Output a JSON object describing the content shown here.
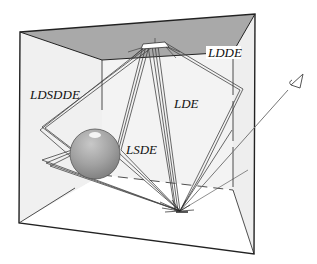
{
  "figure": {
    "colors": {
      "background": "#ffffff",
      "ceiling": "#a9a9a9",
      "walls": "#f0f0f0",
      "floor": "#ffffff",
      "sphere": "#9a9a9a",
      "edges": "#222222",
      "paths": "#444444"
    },
    "labels": {
      "ldsdde": "LDSDDE",
      "ldde": "LDDE",
      "lde": "LDE",
      "lsde": "LSDE"
    },
    "icons": {
      "light": "area-light-icon",
      "eye": "eye-icon",
      "sphere": "specular-sphere"
    }
  }
}
